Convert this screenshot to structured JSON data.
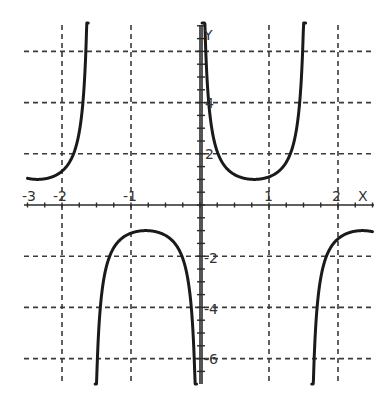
{
  "chart_data": {
    "type": "line",
    "title": "",
    "function": "y = csc(2x) = 1/sin(2x)",
    "xlabel": "X",
    "ylabel": "Y",
    "xlim": [
      -2.5,
      2.5
    ],
    "ylim": [
      -7,
      7
    ],
    "grid": true,
    "x_ticks": [
      -3,
      -2,
      -1,
      1,
      2
    ],
    "x_tick_labels": [
      "-3",
      "-2",
      "-1",
      "1",
      "2"
    ],
    "x_gridlines": [
      -2,
      -1,
      1,
      2
    ],
    "y_gridlines": [
      6,
      4,
      2,
      -2,
      -4,
      -6
    ],
    "y_tick_labels": [
      "4",
      "2",
      "-2",
      "-4",
      "-6"
    ],
    "asymptotes": [
      -1.571,
      0,
      1.571
    ],
    "series": [
      {
        "name": "branch-left-upper",
        "domain": [
          -2.5,
          -1.62
        ],
        "x": [
          -2.5,
          -2.25,
          -2.0,
          -1.85,
          -1.75,
          -1.68,
          -1.63
        ],
        "y": [
          1.04,
          1.02,
          1.32,
          1.85,
          2.87,
          4.6,
          8.3
        ]
      },
      {
        "name": "branch-middle-lower",
        "domain": [
          -1.52,
          -0.05
        ],
        "x": [
          -1.52,
          -1.4,
          -1.2,
          -1.0,
          -0.785,
          -0.6,
          -0.4,
          -0.2,
          -0.09
        ],
        "y": [
          -10.1,
          -2.98,
          -1.48,
          -1.1,
          -1.0,
          -1.07,
          -1.39,
          -2.57,
          -5.6
        ]
      },
      {
        "name": "branch-middle-upper",
        "domain": [
          0.03,
          1.53
        ],
        "x": [
          0.05,
          0.1,
          0.2,
          0.4,
          0.6,
          0.785,
          1.0,
          1.2,
          1.4,
          1.53
        ],
        "y": [
          10.0,
          5.03,
          2.57,
          1.39,
          1.07,
          1.0,
          1.1,
          1.48,
          2.98,
          12.5
        ]
      },
      {
        "name": "branch-right-lower",
        "domain": [
          1.62,
          2.5
        ],
        "x": [
          1.63,
          1.68,
          1.75,
          1.85,
          2.0,
          2.25,
          2.5
        ],
        "y": [
          -8.3,
          -4.6,
          -2.87,
          -1.85,
          -1.32,
          -1.02,
          -1.04
        ]
      }
    ]
  },
  "labels": {
    "x_axis_name": "X",
    "y_axis_name": "Y",
    "x_neg3": "-3",
    "x_neg2": "-2",
    "x_neg1": "-1",
    "x_1": "1",
    "x_2": "2",
    "y_4": "4",
    "y_2": "2",
    "y_neg2": "-2",
    "y_neg4": "-4",
    "y_neg6": "-6"
  },
  "colors": {
    "curve": "#1a1a1a",
    "grid": "#3a3a3a",
    "background": "#ffffff"
  }
}
